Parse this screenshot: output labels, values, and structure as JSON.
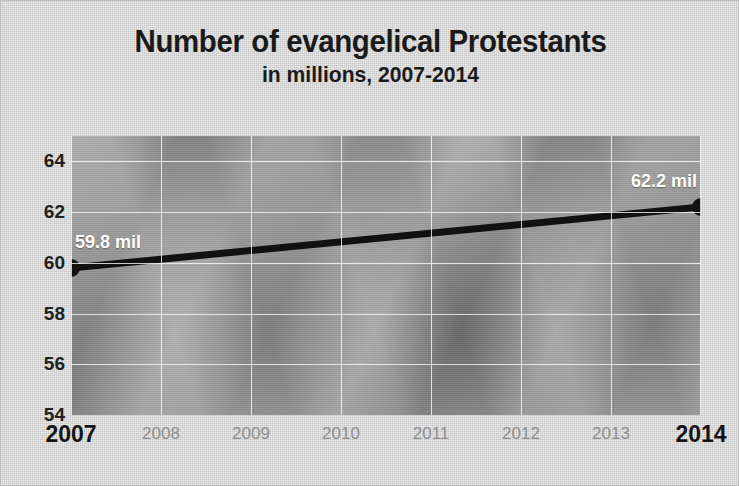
{
  "chart_data": {
    "type": "line",
    "title": "Number of evangelical Protestants",
    "subtitle": "in millions, 2007-2014",
    "xlabel": "",
    "ylabel": "",
    "x": [
      2007,
      2008,
      2009,
      2010,
      2011,
      2012,
      2013,
      2014
    ],
    "xtick_labels": [
      "2007",
      "2008",
      "2009",
      "2010",
      "2011",
      "2012",
      "2013",
      "2014"
    ],
    "xtick_emphasis": [
      "major",
      "minor",
      "minor",
      "minor",
      "minor",
      "minor",
      "minor",
      "major"
    ],
    "xlim": [
      2007,
      2014
    ],
    "ylim": [
      54,
      65
    ],
    "ytick_labels": [
      "54",
      "56",
      "58",
      "60",
      "62",
      "64"
    ],
    "yticks": [
      54,
      56,
      58,
      60,
      62,
      64
    ],
    "grid": true,
    "legend": null,
    "series": [
      {
        "name": "Evangelical Protestants",
        "points": [
          {
            "x": 2007,
            "y": 59.8,
            "label": "59.8 mil"
          },
          {
            "x": 2014,
            "y": 62.2,
            "label": "62.2 mil"
          }
        ],
        "line_color": "#111111",
        "marker_color": "#111111"
      }
    ],
    "annotations": [
      {
        "text": "59.8 mil",
        "x": 2007,
        "y": 59.8,
        "color": "#ffffff"
      },
      {
        "text": "62.2 mil",
        "x": 2014,
        "y": 62.2,
        "color": "#ffffff"
      }
    ],
    "colors": {
      "card_background": "#cfcfcf",
      "plot_background": "#9a9a9a",
      "gridline": "#ffffff",
      "line": "#111111",
      "title_text": "#1a1a1a",
      "tick_major": "#141414",
      "tick_minor": "#8e8e8e",
      "data_label": "#ffffff"
    }
  }
}
